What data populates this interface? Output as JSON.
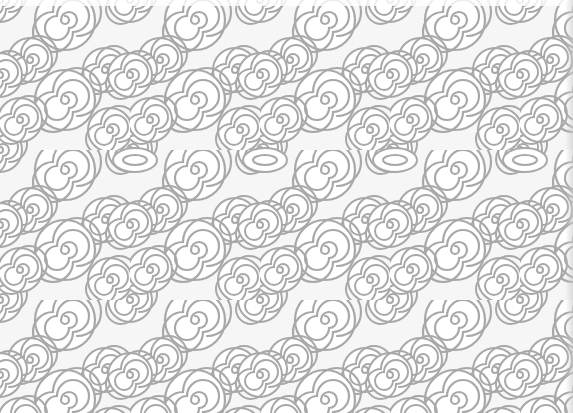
{
  "image": {
    "description": "Seamless decorative pattern of overlapping white spirals outlined in gray",
    "colors": {
      "background": "#f6f6f6",
      "spiral_fill": "#ffffff",
      "spiral_stroke": "#a8a8a8"
    },
    "pattern": {
      "motif": "spiral",
      "tile_width": 130,
      "tile_height": 150,
      "mirror_band_y": 160
    }
  }
}
